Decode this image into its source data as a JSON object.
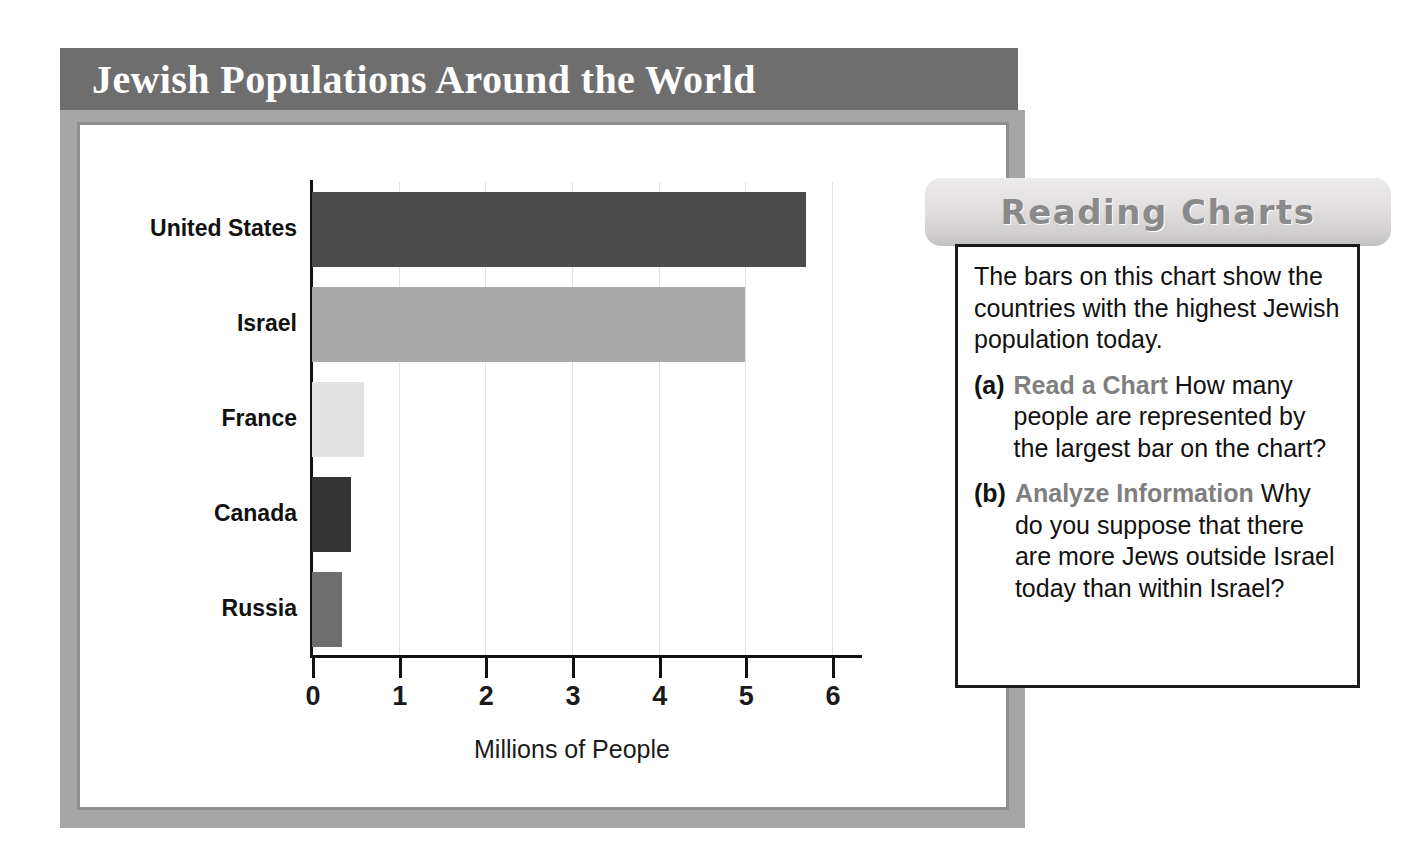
{
  "header": {
    "title": "Jewish Populations Around the World",
    "band_color": "#6e6e6e",
    "title_color": "#ffffff"
  },
  "frame": {
    "outer_color": "#a6a6a6",
    "inner_border_color": "#8f8f8f",
    "panel_color": "#ffffff"
  },
  "chart_data": {
    "type": "bar",
    "orientation": "horizontal",
    "title": "Jewish Populations Around the World",
    "categories": [
      "United States",
      "Israel",
      "France",
      "Canada",
      "Russia"
    ],
    "values": [
      5.7,
      5.0,
      0.6,
      0.45,
      0.35
    ],
    "bar_colors": [
      "#4a4a4a",
      "#a9a9a9",
      "#e2e2e2",
      "#333333",
      "#6e6e6e"
    ],
    "xlabel": "Millions of People",
    "ylabel": "",
    "xlim": [
      0,
      6
    ],
    "xticks": [
      0,
      1,
      2,
      3,
      4,
      5,
      6
    ],
    "xtick_labels": [
      "0",
      "1",
      "2",
      "3",
      "4",
      "5",
      "6"
    ],
    "grid": "vertical",
    "gridline_color": "#e3e3e3",
    "legend": "none",
    "axis_color": "#111111"
  },
  "callout": {
    "tab_title": "Reading Charts",
    "tab_title_color": "#8a8a8a",
    "intro": "The bars on this chart show the countries with the highest Jewish population today.",
    "items": [
      {
        "marker": "(a)",
        "term": "Read a Chart",
        "text": "How many people are represented by the largest bar on the chart?"
      },
      {
        "marker": "(b)",
        "term": "Analyze Information",
        "text": "Why do you suppose that there are more Jews outside Israel today than within Israel?"
      }
    ]
  }
}
